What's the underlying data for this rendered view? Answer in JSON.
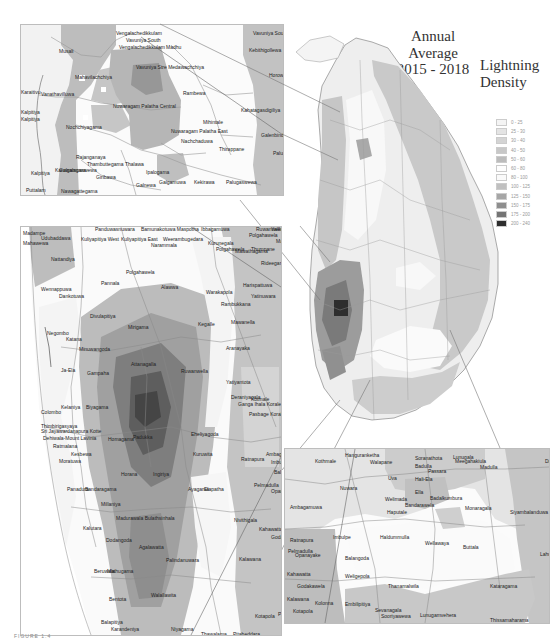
{
  "title": {
    "line1": "Annual",
    "line2": "Average",
    "line3": "2015 - 2018"
  },
  "legend": {
    "title_line1": "Lightning",
    "title_line2": "Density",
    "classes": [
      {
        "range": "0 - 25",
        "color": "#f4f4f4"
      },
      {
        "range": "25 - 30",
        "color": "#e4e4e4"
      },
      {
        "range": "30 - 40",
        "color": "#d4d4d4"
      },
      {
        "range": "40 - 50",
        "color": "#c8c8c8"
      },
      {
        "range": "50 - 60",
        "color": "#bcbcbc"
      },
      {
        "range": "60 - 80",
        "color": "#fefefe"
      },
      {
        "range": "80 - 100",
        "color": "#fafafa"
      },
      {
        "range": "100 - 125",
        "color": "#c0c0c0"
      },
      {
        "range": "125 - 150",
        "color": "#a6a6a6"
      },
      {
        "range": "150 - 175",
        "color": "#8e8e8e"
      },
      {
        "range": "175 - 200",
        "color": "#747474"
      },
      {
        "range": "200 - 240",
        "color": "#2e2e2e"
      }
    ]
  },
  "inset_north": {
    "place_labels": [
      {
        "text": "Vengalachedikkulam",
        "x": 95,
        "y": 6
      },
      {
        "text": "Vavuniya South",
        "x": 105,
        "y": 13
      },
      {
        "text": "Vengalachedikkulam",
        "x": 98,
        "y": 20
      },
      {
        "text": "Vavuniya South",
        "x": 232,
        "y": 6
      },
      {
        "text": "Madhu",
        "x": 145,
        "y": 20
      },
      {
        "text": "Kebithigollewa",
        "x": 228,
        "y": 23
      },
      {
        "text": "Musali",
        "x": 38,
        "y": 24
      },
      {
        "text": "Vavuniya Stre Medawachchiya",
        "x": 115,
        "y": 40
      },
      {
        "text": "Mahavilachchiya",
        "x": 54,
        "y": 50
      },
      {
        "text": "Horowpothana",
        "x": 248,
        "y": 48
      },
      {
        "text": "Rambewa",
        "x": 162,
        "y": 66
      },
      {
        "text": "Karaitivu",
        "x": 0,
        "y": 65
      },
      {
        "text": "Vanathavilluwa",
        "x": 20,
        "y": 67
      },
      {
        "text": "Nuwaragam Palatha Central",
        "x": 92,
        "y": 79
      },
      {
        "text": "Kahatagasdigiliya",
        "x": 220,
        "y": 83
      },
      {
        "text": "Kalpitiya",
        "x": 0,
        "y": 85
      },
      {
        "text": "Kalpitiya",
        "x": 0,
        "y": 92
      },
      {
        "text": "Nochchiyagama",
        "x": 45,
        "y": 100
      },
      {
        "text": "Mihintale",
        "x": 182,
        "y": 95
      },
      {
        "text": "Nuwaragam Palatha East",
        "x": 150,
        "y": 104
      },
      {
        "text": "Galenbindunuwewa",
        "x": 240,
        "y": 108
      },
      {
        "text": "Nachchaduwa",
        "x": 160,
        "y": 114
      },
      {
        "text": "Thirappane",
        "x": 198,
        "y": 122
      },
      {
        "text": "Rajanganaya",
        "x": 55,
        "y": 130
      },
      {
        "text": "Thambuttegama",
        "x": 66,
        "y": 137
      },
      {
        "text": "Thalawa",
        "x": 104,
        "y": 137
      },
      {
        "text": "Palugaswewa",
        "x": 252,
        "y": 126
      },
      {
        "text": "Kalpitiya",
        "x": 10,
        "y": 146
      },
      {
        "text": "Karuwalagaswewa",
        "x": 34,
        "y": 143
      },
      {
        "text": "Galgamuwa",
        "x": 38,
        "y": 143
      },
      {
        "text": "Ipalogama",
        "x": 125,
        "y": 145
      },
      {
        "text": "Galgamuwa",
        "x": 138,
        "y": 155
      },
      {
        "text": "Kekirawa",
        "x": 173,
        "y": 155
      },
      {
        "text": "Palugaswewa",
        "x": 205,
        "y": 155
      },
      {
        "text": "Puttalam",
        "x": 5,
        "y": 163
      },
      {
        "text": "Nawagattegama",
        "x": 40,
        "y": 164
      },
      {
        "text": "Giribawa",
        "x": 75,
        "y": 150
      },
      {
        "text": "Galnewa",
        "x": 115,
        "y": 158
      }
    ]
  },
  "inset_west": {
    "place_labels": [
      {
        "text": "Madampe",
        "x": 2,
        "y": 4
      },
      {
        "text": "Panduwasnuwara",
        "x": 74,
        "y": 0
      },
      {
        "text": "Bamunakotuwa Maspotha",
        "x": 120,
        "y": 0
      },
      {
        "text": "Ibbagamuwa",
        "x": 180,
        "y": 0
      },
      {
        "text": "Yalewella",
        "x": 250,
        "y": 0
      },
      {
        "text": "Udubaddawa",
        "x": 20,
        "y": 9
      },
      {
        "text": "Kuliyapitiya West",
        "x": 60,
        "y": 10
      },
      {
        "text": "Kuliyapitiya East",
        "x": 100,
        "y": 10
      },
      {
        "text": "Weerambugedara",
        "x": 142,
        "y": 10
      },
      {
        "text": "Polgahawela",
        "x": 228,
        "y": 6
      },
      {
        "text": "Mawathagama",
        "x": 255,
        "y": 12
      },
      {
        "text": "Kurunegala",
        "x": 187,
        "y": 14
      },
      {
        "text": "Mahawewa",
        "x": 2,
        "y": 14
      },
      {
        "text": "Narammala",
        "x": 130,
        "y": 16
      },
      {
        "text": "Mawathagama",
        "x": 214,
        "y": 22
      },
      {
        "text": "Nattandiya",
        "x": 30,
        "y": 30
      },
      {
        "text": "Polgahawela",
        "x": 195,
        "y": 20
      },
      {
        "text": "Polgahawela",
        "x": 105,
        "y": 43
      },
      {
        "text": "Rideegama",
        "x": 240,
        "y": 34
      },
      {
        "text": "Pannala",
        "x": 80,
        "y": 54
      },
      {
        "text": "Alawwa",
        "x": 140,
        "y": 58
      },
      {
        "text": "Harispattuwa",
        "x": 222,
        "y": 56
      },
      {
        "text": "Wennappuwa",
        "x": 20,
        "y": 60
      },
      {
        "text": "Dankotuwa",
        "x": 38,
        "y": 67
      },
      {
        "text": "Warakapola",
        "x": 185,
        "y": 63
      },
      {
        "text": "Yatinuwara",
        "x": 230,
        "y": 67
      },
      {
        "text": "Divulapitiya",
        "x": 69,
        "y": 87
      },
      {
        "text": "Rambukkana",
        "x": 200,
        "y": 75
      },
      {
        "text": "Mirigama",
        "x": 107,
        "y": 98
      },
      {
        "text": "Kegalle",
        "x": 177,
        "y": 95
      },
      {
        "text": "Mawanella",
        "x": 210,
        "y": 93
      },
      {
        "text": "Negombo",
        "x": 26,
        "y": 104
      },
      {
        "text": "Katana",
        "x": 45,
        "y": 110
      },
      {
        "text": "Minuwangoda",
        "x": 58,
        "y": 120
      },
      {
        "text": "Attanagalla",
        "x": 110,
        "y": 135
      },
      {
        "text": "Ruwanwella",
        "x": 160,
        "y": 142
      },
      {
        "text": "Ja-Ela",
        "x": 40,
        "y": 141
      },
      {
        "text": "Gampaha",
        "x": 66,
        "y": 144
      },
      {
        "text": "Aranayaka",
        "x": 205,
        "y": 119
      },
      {
        "text": "Deraniyagala",
        "x": 210,
        "y": 168
      },
      {
        "text": "Colombo",
        "x": 20,
        "y": 183
      },
      {
        "text": "Kelaniya",
        "x": 40,
        "y": 178
      },
      {
        "text": "Biyagama",
        "x": 65,
        "y": 178
      },
      {
        "text": "Thimbirigasyaya",
        "x": 20,
        "y": 197
      },
      {
        "text": "Sri Jayawardanapura Kotte",
        "x": 20,
        "y": 202
      },
      {
        "text": "Dehiwala-Mount Lavinia",
        "x": 22,
        "y": 209
      },
      {
        "text": "Ratmalana",
        "x": 32,
        "y": 217
      },
      {
        "text": "Kesbewa",
        "x": 50,
        "y": 225
      },
      {
        "text": "Moratuwa",
        "x": 38,
        "y": 232
      },
      {
        "text": "Homagama",
        "x": 87,
        "y": 210
      },
      {
        "text": "Padukka",
        "x": 112,
        "y": 208
      },
      {
        "text": "Horana",
        "x": 100,
        "y": 245
      },
      {
        "text": "Ingiriya",
        "x": 132,
        "y": 245
      },
      {
        "text": "Panadura",
        "x": 46,
        "y": 260
      },
      {
        "text": "Bandaragama",
        "x": 64,
        "y": 260
      },
      {
        "text": "Millaniya",
        "x": 80,
        "y": 275
      },
      {
        "text": "Madurawala Bulathsinhala",
        "x": 95,
        "y": 289
      },
      {
        "text": "Kalutara",
        "x": 62,
        "y": 299
      },
      {
        "text": "Dodangoda",
        "x": 85,
        "y": 311
      },
      {
        "text": "Agalawatta",
        "x": 118,
        "y": 318
      },
      {
        "text": "Palindanuwara",
        "x": 145,
        "y": 331
      },
      {
        "text": "Beruwala",
        "x": 73,
        "y": 342
      },
      {
        "text": "Mathugama",
        "x": 86,
        "y": 342
      },
      {
        "text": "Bentota",
        "x": 88,
        "y": 370
      },
      {
        "text": "Walallawita",
        "x": 130,
        "y": 366
      },
      {
        "text": "Balapitiya",
        "x": 80,
        "y": 393
      },
      {
        "text": "Karandeniya",
        "x": 90,
        "y": 400
      },
      {
        "text": "Niyagama",
        "x": 150,
        "y": 400
      },
      {
        "text": "Thawalama",
        "x": 180,
        "y": 405
      },
      {
        "text": "Welivitiya-Divithura",
        "x": 105,
        "y": 410
      },
      {
        "text": "Ambalangoda",
        "x": 95,
        "y": 418
      },
      {
        "text": "Nagoda",
        "x": 160,
        "y": 415
      },
      {
        "text": "Ruwanwella",
        "x": 235,
        "y": 0
      },
      {
        "text": "Thumpane",
        "x": 230,
        "y": 20
      },
      {
        "text": "Yatiyantota",
        "x": 205,
        "y": 153
      },
      {
        "text": "Eheliyagoda",
        "x": 170,
        "y": 205
      },
      {
        "text": "Kuruwita",
        "x": 172,
        "y": 225
      },
      {
        "text": "Ayagama",
        "x": 167,
        "y": 260
      },
      {
        "text": "Elapatha",
        "x": 183,
        "y": 260
      },
      {
        "text": "Ratnapura",
        "x": 220,
        "y": 230
      },
      {
        "text": "Imbulpe",
        "x": 250,
        "y": 233
      },
      {
        "text": "Balangoda",
        "x": 253,
        "y": 243
      },
      {
        "text": "Pelmadulla",
        "x": 233,
        "y": 256
      },
      {
        "text": "Opanayake",
        "x": 250,
        "y": 262
      },
      {
        "text": "Nivithigala",
        "x": 213,
        "y": 291
      },
      {
        "text": "Kahawatta",
        "x": 238,
        "y": 300
      },
      {
        "text": "Godakawela",
        "x": 250,
        "y": 308
      },
      {
        "text": "Kalawana",
        "x": 218,
        "y": 330
      },
      {
        "text": "Kolonna",
        "x": 260,
        "y": 334
      },
      {
        "text": "Kotapola",
        "x": 234,
        "y": 387
      },
      {
        "text": "Pasgoda",
        "x": 257,
        "y": 385
      },
      {
        "text": "Pitabeddara",
        "x": 212,
        "y": 405
      },
      {
        "text": "Akuressa",
        "x": 245,
        "y": 418
      },
      {
        "text": "Ganga Ihala Korale",
        "x": 217,
        "y": 175
      },
      {
        "text": "Pasbage Korale",
        "x": 228,
        "y": 185
      },
      {
        "text": "Nuwara",
        "x": 262,
        "y": 200
      },
      {
        "text": "Ambagamuwa",
        "x": 245,
        "y": 225
      },
      {
        "text": "Udapalatha",
        "x": 263,
        "y": 165
      },
      {
        "text": "Doluwa",
        "x": 262,
        "y": 140
      },
      {
        "text": "Kotmale",
        "x": 230,
        "y": 170
      }
    ]
  },
  "inset_southeast": {
    "place_labels": [
      {
        "text": "Hanguranketha",
        "x": 60,
        "y": 4
      },
      {
        "text": "Soranathota",
        "x": 130,
        "y": 7
      },
      {
        "text": "Lunugala",
        "x": 168,
        "y": 6
      },
      {
        "text": "Meegahakiula",
        "x": 170,
        "y": 10
      },
      {
        "text": "Kothmale",
        "x": 30,
        "y": 10
      },
      {
        "text": "Walapane",
        "x": 85,
        "y": 11
      },
      {
        "text": "Badulla",
        "x": 130,
        "y": 15
      },
      {
        "text": "Passara",
        "x": 143,
        "y": 20
      },
      {
        "text": "Madulla",
        "x": 195,
        "y": 16
      },
      {
        "text": "Damana",
        "x": 260,
        "y": 10
      },
      {
        "text": "Uva",
        "x": 103,
        "y": 27
      },
      {
        "text": "Hali-Ela",
        "x": 130,
        "y": 28
      },
      {
        "text": "Nuwara",
        "x": 55,
        "y": 37
      },
      {
        "text": "Ella",
        "x": 130,
        "y": 41
      },
      {
        "text": "Welimada",
        "x": 100,
        "y": 48
      },
      {
        "text": "Bandarawela",
        "x": 120,
        "y": 54
      },
      {
        "text": "Haputale",
        "x": 102,
        "y": 61
      },
      {
        "text": "Badalkumbura",
        "x": 145,
        "y": 47
      },
      {
        "text": "Monaragala",
        "x": 180,
        "y": 57
      },
      {
        "text": "Siyambalanduwa",
        "x": 225,
        "y": 61
      },
      {
        "text": "Ambagamuwa",
        "x": 5,
        "y": 56
      },
      {
        "text": "Imbulpe",
        "x": 48,
        "y": 86
      },
      {
        "text": "Haldummulla",
        "x": 95,
        "y": 86
      },
      {
        "text": "Wellawaya",
        "x": 140,
        "y": 92
      },
      {
        "text": "Buttala",
        "x": 178,
        "y": 96
      },
      {
        "text": "Ratnapura",
        "x": 5,
        "y": 89
      },
      {
        "text": "Pelmadulla",
        "x": 3,
        "y": 100
      },
      {
        "text": "Opanayake",
        "x": 10,
        "y": 104
      },
      {
        "text": "Balangoda",
        "x": 60,
        "y": 107
      },
      {
        "text": "Lahugala",
        "x": 255,
        "y": 103
      },
      {
        "text": "Weligepola",
        "x": 60,
        "y": 125
      },
      {
        "text": "Kahawatta",
        "x": 2,
        "y": 123
      },
      {
        "text": "Godakawela",
        "x": 12,
        "y": 135
      },
      {
        "text": "Thanamalwila",
        "x": 103,
        "y": 135
      },
      {
        "text": "Kataragama",
        "x": 205,
        "y": 135
      },
      {
        "text": "Kalawana",
        "x": 2,
        "y": 148
      },
      {
        "text": "Kolonna",
        "x": 30,
        "y": 152
      },
      {
        "text": "Embilipitiya",
        "x": 60,
        "y": 153
      },
      {
        "text": "Kotapola",
        "x": 8,
        "y": 160
      },
      {
        "text": "Sevanagala",
        "x": 90,
        "y": 159
      },
      {
        "text": "Sooriyawewa",
        "x": 96,
        "y": 165
      },
      {
        "text": "Lunugamvehera",
        "x": 135,
        "y": 164
      },
      {
        "text": "Thissamaharama",
        "x": 205,
        "y": 169
      }
    ]
  },
  "figure_caption": "FIGURE 1.4"
}
